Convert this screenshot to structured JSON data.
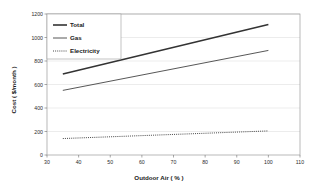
{
  "chart_data": {
    "type": "line",
    "title": "",
    "xlabel": "Outdoor Air ( % )",
    "ylabel": "Cost ( $/month )",
    "xlim": [
      30,
      110
    ],
    "ylim": [
      0,
      1200
    ],
    "xticks": [
      30,
      40,
      50,
      60,
      70,
      80,
      90,
      100,
      110
    ],
    "yticks": [
      0,
      200,
      400,
      600,
      800,
      1000,
      1200
    ],
    "xtick_labels": [
      "30",
      "40",
      "50",
      "60",
      "70",
      "80",
      "90",
      "100",
      "110"
    ],
    "ytick_labels": [
      "0",
      "200",
      "400",
      "600",
      "800",
      "1000",
      "1200"
    ],
    "grid": "horizontal",
    "legend_position": "top-left-inside",
    "x": [
      35,
      100
    ],
    "series": [
      {
        "name": "Total",
        "values": [
          690,
          1110
        ],
        "style": "solid",
        "width": 1.6,
        "color": "#333333"
      },
      {
        "name": "Gas",
        "values": [
          550,
          890
        ],
        "style": "solid",
        "width": 0.9,
        "color": "#444444"
      },
      {
        "name": "Electricity",
        "values": [
          140,
          205
        ],
        "style": "dotted",
        "width": 0.9,
        "color": "#333333"
      }
    ]
  },
  "legend": {
    "items": [
      {
        "label": "Total"
      },
      {
        "label": "Gas"
      },
      {
        "label": "Electricity"
      }
    ]
  },
  "axes": {
    "x_title": "Outdoor Air ( % )",
    "y_title": "Cost ( $/month )"
  },
  "colors": {
    "plot_border": "#9a9a9a",
    "gridline": "#d8d8d8",
    "axis_line": "#6e6e6e",
    "text": "#1a1a1a",
    "background": "#ffffff"
  }
}
